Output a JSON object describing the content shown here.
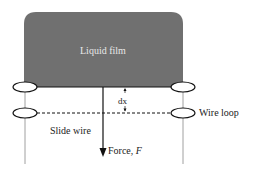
{
  "diagram": {
    "colors": {
      "film": "#707070",
      "line": "#111111",
      "frame": "#888888",
      "film_text": "#e8e8e8",
      "text": "#222222"
    },
    "labels": {
      "liquid_film": "Liquid film",
      "dx": "dx",
      "wire_loop": "Wire loop",
      "slide_wire": "Slide wire",
      "force_prefix": "Force, ",
      "force_symbol": "F"
    }
  }
}
